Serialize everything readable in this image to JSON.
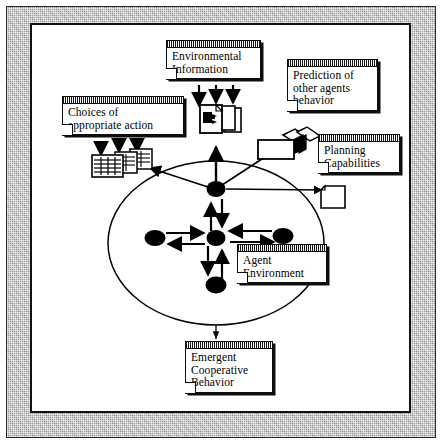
{
  "figure": {
    "kind": "agent-architecture-diagram",
    "frame_color": "#9a9a9a",
    "ink_color": "#000000",
    "paper_color": "#ffffff"
  },
  "notes": {
    "environmental_information": {
      "label": "Environmental\nInformation",
      "line1": "Environmental",
      "line2": "Information"
    },
    "prediction_of_other_agents_behavior": {
      "line1": "Prediction of",
      "line2": "other agents",
      "line3": "behavior"
    },
    "choices_of_appropriate_action": {
      "line1": "Choices of",
      "line2": "appropriate action"
    },
    "planning_capabilities": {
      "line1": "Planning",
      "line2": "Capabilities"
    },
    "agent_environment": {
      "line1": "Agent",
      "line2": "Environment"
    },
    "emergent_cooperative_behavior": {
      "line1": "Emergent",
      "line2": "Cooperative",
      "line3": "Behavior"
    }
  },
  "icons": {
    "perception_doc_stack": "document-stack-icon",
    "action_table_stack": "table-stack-icon",
    "plan_card_stack": "card-stack-icon",
    "blank_page": "blank-page-icon"
  },
  "graph": {
    "nodes": [
      {
        "id": "coordinator",
        "name": "coordinator-agent-node",
        "cx": 216,
        "cy": 189,
        "rx": 9.5,
        "ry": 8
      },
      {
        "id": "center",
        "name": "center-agent-node",
        "cx": 216,
        "cy": 238,
        "rx": 9.5,
        "ry": 8
      },
      {
        "id": "left",
        "name": "left-agent-node",
        "cx": 155,
        "cy": 238,
        "rx": 10,
        "ry": 8
      },
      {
        "id": "right",
        "name": "right-agent-node",
        "cx": 283,
        "cy": 236,
        "rx": 10,
        "ry": 8
      },
      {
        "id": "bottom",
        "name": "bottom-agent-node",
        "cx": 216,
        "cy": 285,
        "rx": 10,
        "ry": 8.5
      }
    ],
    "environment_ellipse": {
      "cx": 216,
      "cy": 243,
      "rx": 108,
      "ry": 82
    },
    "edges": [
      {
        "from": "coordinator",
        "to": "perception-stack",
        "kind": "line"
      },
      {
        "from": "coordinator",
        "to": "action-stack",
        "kind": "arrow"
      },
      {
        "from": "coordinator",
        "to": "plan-stack",
        "kind": "line"
      },
      {
        "from": "coordinator",
        "to": "blank-page",
        "kind": "arrow"
      },
      {
        "from": "center",
        "to": "coordinator",
        "kind": "bidirectional"
      },
      {
        "from": "center",
        "to": "left",
        "kind": "bidirectional"
      },
      {
        "from": "center",
        "to": "right",
        "kind": "bidirectional"
      },
      {
        "from": "center",
        "to": "bottom",
        "kind": "bidirectional"
      },
      {
        "from": "environment_ellipse",
        "to": "emergent-cooperative-behavior-note",
        "kind": "arrow"
      }
    ]
  }
}
